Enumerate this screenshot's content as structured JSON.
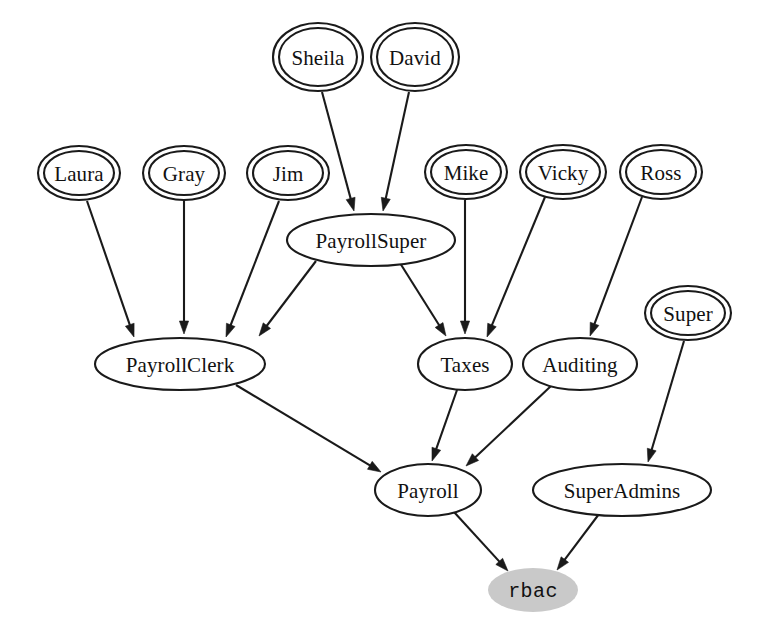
{
  "diagram": {
    "background_color": "#ffffff",
    "stroke_color": "#1a1a1a",
    "highlight_fill": "#c9c9c9"
  },
  "nodes": [
    {
      "id": "Sheila",
      "label": "Sheila",
      "kind": "user",
      "shape": "doublecircle",
      "cx": 318,
      "cy": 57,
      "rx": 45,
      "ry": 34,
      "fill": "#ffffff"
    },
    {
      "id": "David",
      "label": "David",
      "kind": "user",
      "shape": "doublecircle",
      "cx": 415,
      "cy": 57,
      "rx": 44,
      "ry": 34,
      "fill": "#ffffff"
    },
    {
      "id": "Laura",
      "label": "Laura",
      "kind": "user",
      "shape": "doublecircle",
      "cx": 79,
      "cy": 173,
      "rx": 41,
      "ry": 27,
      "fill": "#ffffff"
    },
    {
      "id": "Gray",
      "label": "Gray",
      "kind": "user",
      "shape": "doublecircle",
      "cx": 184,
      "cy": 173,
      "rx": 41,
      "ry": 27,
      "fill": "#ffffff"
    },
    {
      "id": "Jim",
      "label": "Jim",
      "kind": "user",
      "shape": "doublecircle",
      "cx": 288,
      "cy": 173,
      "rx": 41,
      "ry": 27,
      "fill": "#ffffff"
    },
    {
      "id": "Mike",
      "label": "Mike",
      "kind": "user",
      "shape": "doublecircle",
      "cx": 466,
      "cy": 172,
      "rx": 41,
      "ry": 27,
      "fill": "#ffffff"
    },
    {
      "id": "Vicky",
      "label": "Vicky",
      "kind": "user",
      "shape": "doublecircle",
      "cx": 563,
      "cy": 172,
      "rx": 43,
      "ry": 27,
      "fill": "#ffffff"
    },
    {
      "id": "Ross",
      "label": "Ross",
      "kind": "user",
      "shape": "doublecircle",
      "cx": 661,
      "cy": 172,
      "rx": 41,
      "ry": 27,
      "fill": "#ffffff"
    },
    {
      "id": "Super",
      "label": "Super",
      "kind": "user",
      "shape": "doublecircle",
      "cx": 688,
      "cy": 313,
      "rx": 43,
      "ry": 27,
      "fill": "#ffffff"
    },
    {
      "id": "PayrollSuper",
      "label": "PayrollSuper",
      "kind": "role",
      "shape": "ellipse",
      "cx": 371,
      "cy": 240,
      "rx": 84,
      "ry": 26,
      "fill": "#ffffff"
    },
    {
      "id": "PayrollClerk",
      "label": "PayrollClerk",
      "kind": "role",
      "shape": "ellipse",
      "cx": 180,
      "cy": 364,
      "rx": 85,
      "ry": 26,
      "fill": "#ffffff"
    },
    {
      "id": "Taxes",
      "label": "Taxes",
      "kind": "role",
      "shape": "ellipse",
      "cx": 465,
      "cy": 364,
      "rx": 47,
      "ry": 26,
      "fill": "#ffffff"
    },
    {
      "id": "Auditing",
      "label": "Auditing",
      "kind": "role",
      "shape": "ellipse",
      "cx": 580,
      "cy": 364,
      "rx": 57,
      "ry": 26,
      "fill": "#ffffff"
    },
    {
      "id": "Payroll",
      "label": "Payroll",
      "kind": "role",
      "shape": "ellipse",
      "cx": 428,
      "cy": 490,
      "rx": 53,
      "ry": 26,
      "fill": "#ffffff"
    },
    {
      "id": "SuperAdmins",
      "label": "SuperAdmins",
      "kind": "role",
      "shape": "ellipse",
      "cx": 622,
      "cy": 490,
      "rx": 89,
      "ry": 26,
      "fill": "#ffffff"
    },
    {
      "id": "rbac",
      "label": "rbac",
      "kind": "root",
      "shape": "filled-ellipse",
      "cx": 533,
      "cy": 590,
      "rx": 45,
      "ry": 22,
      "fill": "#c9c9c9"
    }
  ],
  "edges": [
    {
      "from": "Sheila",
      "to": "PayrollSuper",
      "x1": 322,
      "y1": 92,
      "x2": 354,
      "y2": 211
    },
    {
      "from": "David",
      "to": "PayrollSuper",
      "x1": 409,
      "y1": 92,
      "x2": 383,
      "y2": 211
    },
    {
      "from": "Laura",
      "to": "PayrollClerk",
      "x1": 87,
      "y1": 201,
      "x2": 134,
      "y2": 337
    },
    {
      "from": "Gray",
      "to": "PayrollClerk",
      "x1": 184,
      "y1": 201,
      "x2": 184,
      "y2": 334
    },
    {
      "from": "Jim",
      "to": "PayrollClerk",
      "x1": 279,
      "y1": 201,
      "x2": 226,
      "y2": 337
    },
    {
      "from": "PayrollSuper",
      "to": "PayrollClerk",
      "x1": 316,
      "y1": 261,
      "x2": 259,
      "y2": 336
    },
    {
      "from": "PayrollSuper",
      "to": "Taxes",
      "x1": 400,
      "y1": 263,
      "x2": 446,
      "y2": 336
    },
    {
      "from": "Mike",
      "to": "Taxes",
      "x1": 465,
      "y1": 200,
      "x2": 465,
      "y2": 334
    },
    {
      "from": "Vicky",
      "to": "Taxes",
      "x1": 545,
      "y1": 197,
      "x2": 487,
      "y2": 337
    },
    {
      "from": "Ross",
      "to": "Auditing",
      "x1": 642,
      "y1": 197,
      "x2": 590,
      "y2": 336
    },
    {
      "from": "PayrollClerk",
      "to": "Payroll",
      "x1": 236,
      "y1": 385,
      "x2": 381,
      "y2": 472
    },
    {
      "from": "Taxes",
      "to": "Payroll",
      "x1": 457,
      "y1": 390,
      "x2": 432,
      "y2": 461
    },
    {
      "from": "Auditing",
      "to": "Payroll",
      "x1": 551,
      "y1": 386,
      "x2": 466,
      "y2": 466
    },
    {
      "from": "Super",
      "to": "SuperAdmins",
      "x1": 684,
      "y1": 341,
      "x2": 648,
      "y2": 462
    },
    {
      "from": "Payroll",
      "to": "rbac",
      "x1": 454,
      "y1": 512,
      "x2": 508,
      "y2": 571
    },
    {
      "from": "SuperAdmins",
      "to": "rbac",
      "x1": 599,
      "y1": 514,
      "x2": 557,
      "y2": 570
    }
  ]
}
